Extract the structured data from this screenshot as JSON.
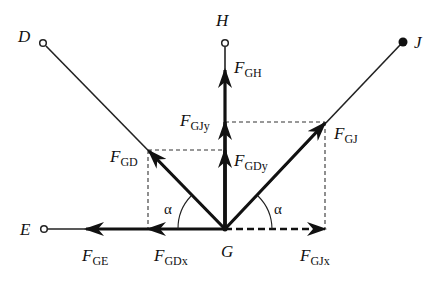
{
  "diagram": {
    "title": "",
    "nodes": {
      "D": {
        "label": "D",
        "x": 43,
        "y": 43,
        "marker": "open-circle"
      },
      "H": {
        "label": "H",
        "x": 225,
        "y": 43,
        "marker": "open-circle"
      },
      "J": {
        "label": "J",
        "x": 403,
        "y": 42,
        "marker": "filled-circle"
      },
      "E": {
        "label": "E",
        "x": 44,
        "y": 229,
        "marker": "open-circle"
      },
      "G": {
        "label": "G",
        "x": 225,
        "y": 229,
        "marker": "joint"
      }
    },
    "forces": {
      "F_GH": {
        "main": "F",
        "sub": "GH"
      },
      "F_GJy": {
        "main": "F",
        "sub": "GJy"
      },
      "F_GDy": {
        "main": "F",
        "sub": "GDy"
      },
      "F_GD": {
        "main": "F",
        "sub": "GD"
      },
      "F_GJ": {
        "main": "F",
        "sub": "GJ"
      },
      "F_GE": {
        "main": "F",
        "sub": "GE"
      },
      "F_GDx": {
        "main": "F",
        "sub": "GDx"
      },
      "F_GJx": {
        "main": "F",
        "sub": "GJx"
      }
    },
    "angles": {
      "left": "α",
      "right": "α"
    },
    "colors": {
      "line": "#111111",
      "background": "#ffffff"
    }
  }
}
